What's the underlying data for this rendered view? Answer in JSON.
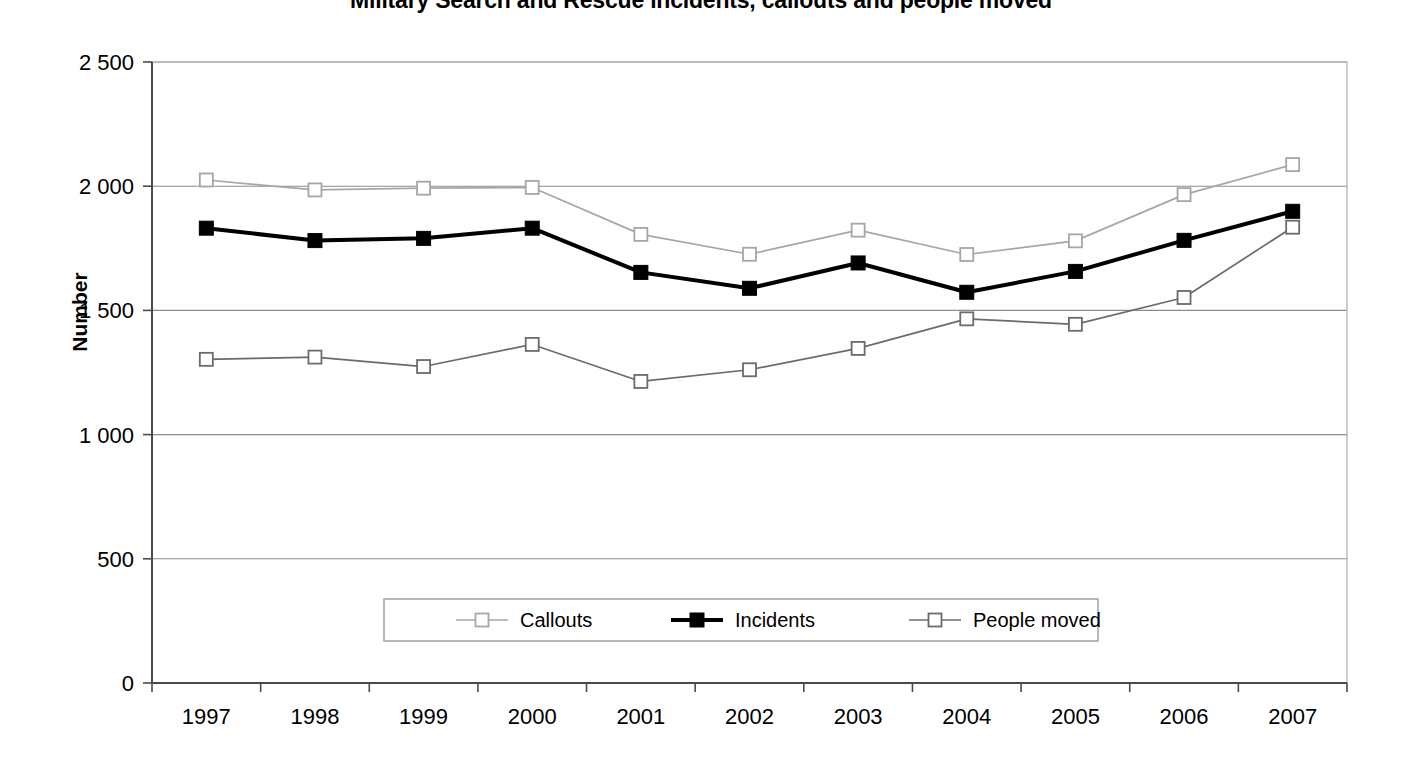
{
  "chart_data": {
    "type": "line",
    "title": "Military Search and Rescue incidents, callouts and people moved",
    "xlabel": "",
    "ylabel": "Number",
    "categories": [
      "1997",
      "1998",
      "1999",
      "2000",
      "2001",
      "2002",
      "2003",
      "2004",
      "2005",
      "2006",
      "2007"
    ],
    "x": [
      1997,
      1998,
      1999,
      2000,
      2001,
      2002,
      2003,
      2004,
      2005,
      2006,
      2007
    ],
    "series": [
      {
        "name": "Callouts",
        "color": "#a6a6a6",
        "marker": "open-square",
        "values": [
          2025,
          1985,
          1992,
          1995,
          1806,
          1726,
          1823,
          1725,
          1780,
          1966,
          2087
        ]
      },
      {
        "name": "Incidents",
        "color": "#000000",
        "marker": "filled-square",
        "values": [
          1831,
          1781,
          1790,
          1831,
          1653,
          1589,
          1691,
          1573,
          1657,
          1782,
          1899
        ]
      },
      {
        "name": "People moved",
        "color": "#6b6b6b",
        "marker": "open-square",
        "values": [
          1303,
          1312,
          1274,
          1363,
          1214,
          1261,
          1347,
          1466,
          1444,
          1552,
          1835
        ]
      }
    ],
    "ylim": [
      0,
      2500
    ],
    "ytick_values": [
      0,
      500,
      1000,
      1500,
      2000,
      2500
    ],
    "ytick_labels": [
      "0",
      "500",
      "1 000",
      "1 500",
      "2 000",
      "2 500"
    ],
    "grid": true,
    "legend_position": "bottom-center"
  },
  "legend": {
    "items": [
      {
        "label": "Callouts"
      },
      {
        "label": "Incidents"
      },
      {
        "label": "People moved"
      }
    ]
  }
}
